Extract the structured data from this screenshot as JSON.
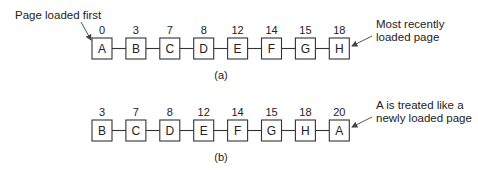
{
  "diagram": {
    "rows": [
      {
        "id": "a",
        "caption": "(a)",
        "pages": [
          {
            "label": "A",
            "time": "0"
          },
          {
            "label": "B",
            "time": "3"
          },
          {
            "label": "C",
            "time": "7"
          },
          {
            "label": "D",
            "time": "8"
          },
          {
            "label": "E",
            "time": "12"
          },
          {
            "label": "F",
            "time": "14"
          },
          {
            "label": "G",
            "time": "15"
          },
          {
            "label": "H",
            "time": "18"
          }
        ],
        "left_note": "Page loaded first",
        "right_note": [
          "Most recently",
          "loaded page"
        ]
      },
      {
        "id": "b",
        "caption": "(b)",
        "pages": [
          {
            "label": "B",
            "time": "3"
          },
          {
            "label": "C",
            "time": "7"
          },
          {
            "label": "D",
            "time": "8"
          },
          {
            "label": "E",
            "time": "12"
          },
          {
            "label": "F",
            "time": "14"
          },
          {
            "label": "G",
            "time": "15"
          },
          {
            "label": "H",
            "time": "18"
          },
          {
            "label": "A",
            "time": "20"
          }
        ],
        "right_note": [
          "A is treated like a",
          "newly loaded page"
        ]
      }
    ]
  }
}
